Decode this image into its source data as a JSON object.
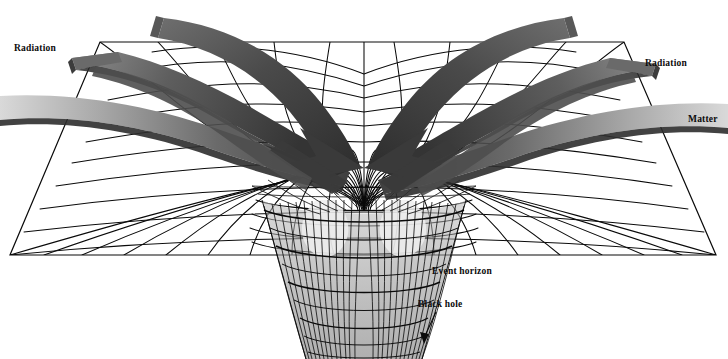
{
  "figure": {
    "background_color": "#ffffff",
    "width": 728,
    "height": 359
  },
  "labels": {
    "radiation_left": "Radiation",
    "radiation_right": "Radiation",
    "matter": "Matter",
    "event_horizon": "Event horizon",
    "black_hole": "Black hole"
  },
  "colors": {
    "grid_line": "#0a0a0a",
    "band_dark": "#3c3c3c",
    "band_mid": "#6e6e6e",
    "band_light": "#b8b8b8",
    "band_pale": "#d8d8d8",
    "arrow_fill": "#3a3a3a",
    "funnel_shade": "#9a9a9a",
    "label_text": "#0b0b0b"
  },
  "geometry": {
    "sheet_top_y": 42,
    "sheet_bottom_y": 255,
    "sheet_top_left_x": 100,
    "sheet_top_right_x": 624,
    "sheet_bottom_left_x": 10,
    "sheet_bottom_right_x": 716,
    "funnel_center_x": 364,
    "funnel_mouth_half_width": 108,
    "funnel_throat_half_width": 44,
    "funnel_throat_y": 359,
    "ring_count": 12,
    "radial_count": 36
  },
  "elements": {
    "grid_description": "Perspective polar mesh of concentric rings and radial meridians warped into a central funnel",
    "bands": [
      {
        "name": "radiation-left-upper",
        "kind": "radiation",
        "side": "left"
      },
      {
        "name": "matter-left",
        "kind": "matter",
        "side": "left"
      },
      {
        "name": "radiation-left-inner",
        "kind": "radiation",
        "side": "left"
      },
      {
        "name": "radiation-right-upper",
        "kind": "radiation",
        "side": "right"
      },
      {
        "name": "matter-right",
        "kind": "matter",
        "side": "right"
      },
      {
        "name": "radiation-right-inner",
        "kind": "radiation",
        "side": "right"
      }
    ],
    "arrowheads": [
      "infall-arrow-left",
      "infall-arrow-right"
    ],
    "pointer": "black-hole-pointer-arrow"
  }
}
